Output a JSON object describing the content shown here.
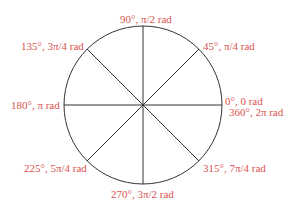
{
  "diagram": {
    "title": "",
    "center": [
      143,
      105
    ],
    "radius": 79,
    "label_color": "#d9534f",
    "line_color": "#333333",
    "labels": [
      {
        "angle": "0°, 0 rad",
        "x": 225,
        "y": 94
      },
      {
        "angle": "360°, 2π rad",
        "x": 229,
        "y": 106
      },
      {
        "angle": "45°, π/4 rad",
        "x": 203,
        "y": 40
      },
      {
        "angle": "90°, π/2 rad",
        "x": 120,
        "y": 13
      },
      {
        "angle": "135°, 3π/4 rad",
        "x": 21,
        "y": 40
      },
      {
        "angle": "180°, π rad",
        "x": 11,
        "y": 99
      },
      {
        "angle": "225°, 5π/4 rad",
        "x": 24,
        "y": 162
      },
      {
        "angle": "270°, 3π/2 rad",
        "x": 111,
        "y": 187
      },
      {
        "angle": "315°, 7π/4 rad",
        "x": 203,
        "y": 162
      }
    ]
  }
}
